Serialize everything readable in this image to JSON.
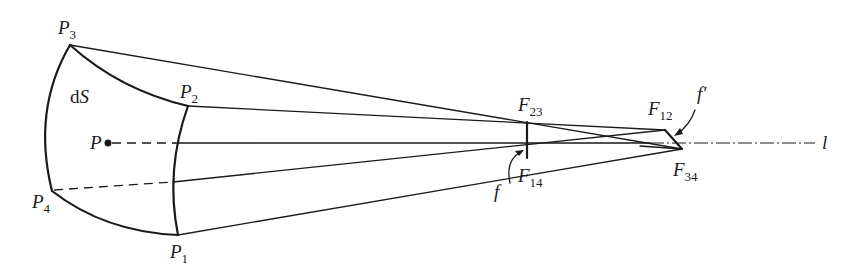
{
  "figure": {
    "type": "geometric-optics diagram",
    "labels": {
      "P3": {
        "main": "P",
        "sub": "3"
      },
      "P2": {
        "main": "P",
        "sub": "2"
      },
      "P1": {
        "main": "P",
        "sub": "1"
      },
      "P4": {
        "main": "P",
        "sub": "4"
      },
      "P": {
        "main": "P"
      },
      "dS": {
        "main_d": "d",
        "main_s": "S"
      },
      "F23": {
        "main": "F",
        "sub": "23"
      },
      "F14": {
        "main": "F",
        "sub": "14"
      },
      "F12": {
        "main": "F",
        "sub": "12"
      },
      "F34": {
        "main": "F",
        "sub": "34"
      },
      "f": {
        "main": "f"
      },
      "f_prime": {
        "main": "f′"
      },
      "axis": {
        "main": "l"
      }
    },
    "points": {
      "P3": [
        70,
        45
      ],
      "P2": [
        188,
        106
      ],
      "P1": [
        178,
        235
      ],
      "P4": [
        52,
        191
      ],
      "P": [
        108,
        143
      ],
      "F23": [
        527,
        122
      ],
      "F14": [
        527,
        158
      ],
      "F12": [
        665,
        130
      ],
      "F34": [
        682,
        149
      ]
    },
    "colors": {
      "ink": "#1a1a1a",
      "background": "#ffffff"
    }
  }
}
